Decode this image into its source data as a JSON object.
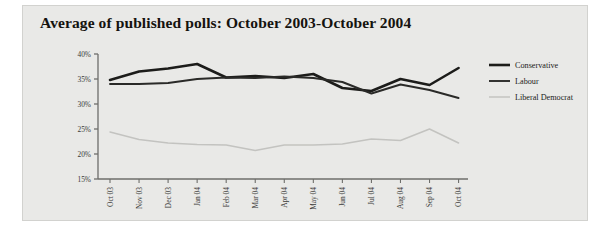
{
  "figure": {
    "title": "Average of published polls: October 2003-October 2004",
    "background_color": "#e9e9e7",
    "border_color": "#d2d2cf"
  },
  "chart_data": {
    "type": "line",
    "title": "Average of published polls: October 2003-October 2004",
    "xlabel": "",
    "ylabel": "",
    "ylim": [
      15,
      40
    ],
    "yticks": [
      15,
      20,
      25,
      30,
      35,
      40
    ],
    "ytick_labels": [
      "15%",
      "20%",
      "25%",
      "30%",
      "35%",
      "40%"
    ],
    "grid": false,
    "legend_position": "right",
    "categories": [
      "Oct 03",
      "Nov 03",
      "Dec 03",
      "Jan 04",
      "Feb 04",
      "Mar 04",
      "Apr 04",
      "May 04",
      "Jun 04",
      "Jul 04",
      "Aug 04",
      "Sep 04",
      "Oct 04"
    ],
    "series": [
      {
        "name": "Conservative",
        "color": "#1c1c1a",
        "width": 2.6,
        "values": [
          34.8,
          36.5,
          37.1,
          38.0,
          35.3,
          35.6,
          35.2,
          36.0,
          33.2,
          32.6,
          35.0,
          33.8,
          37.2
        ]
      },
      {
        "name": "Labour",
        "color": "#2a2a28",
        "width": 1.9,
        "values": [
          34.0,
          34.0,
          34.2,
          35.0,
          35.3,
          35.2,
          35.5,
          35.2,
          34.4,
          32.1,
          33.9,
          32.8,
          31.2
        ]
      },
      {
        "name": "Liberal Democrat",
        "color": "#c3c3c0",
        "width": 1.5,
        "values": [
          24.4,
          22.9,
          22.2,
          21.9,
          21.8,
          20.7,
          21.8,
          21.8,
          22.0,
          23.0,
          22.7,
          25.0,
          22.2
        ]
      }
    ]
  },
  "legend": {
    "items": [
      {
        "label": "Conservative"
      },
      {
        "label": "Labour"
      },
      {
        "label": "Liberal Democrat"
      }
    ]
  }
}
